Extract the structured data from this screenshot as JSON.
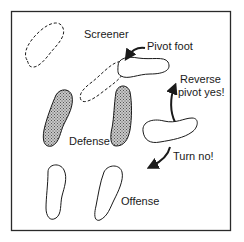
{
  "diagram": {
    "labels": {
      "screener": "Screener",
      "pivot_foot": "Pivot foot",
      "reverse_line1": "Reverse",
      "reverse_line2": "pivot yes!",
      "defense": "Defense",
      "turn_no": "Turn no!",
      "offense": "Offense"
    },
    "elements": {
      "screener_feet": "dashed outline footprints",
      "pivot_foot": "solid outline footprint",
      "defense_feet": "shaded footprints",
      "offense_feet": "solid outline footprints"
    },
    "colors": {
      "stroke": "#1a1a1a",
      "shade": "#9a9a9a",
      "background": "#ffffff"
    }
  }
}
